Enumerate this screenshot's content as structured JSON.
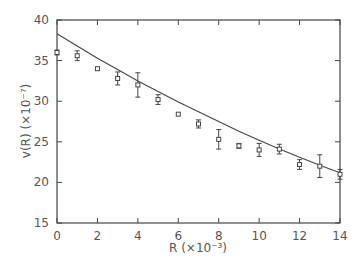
{
  "chart_data": {
    "type": "scatter",
    "title": "",
    "xlabel": "R  (×10⁻³)",
    "ylabel": "v(R)  (×10⁻⁷)",
    "xlim": [
      0,
      14
    ],
    "ylim": [
      15,
      40
    ],
    "xticks": [
      0,
      2,
      4,
      6,
      8,
      10,
      12,
      14
    ],
    "yticks": [
      15,
      20,
      25,
      30,
      35,
      40
    ],
    "grid": false,
    "legend": null,
    "series": [
      {
        "name": "data",
        "marker": "square",
        "x": [
          0,
          1,
          2,
          3,
          4,
          5,
          6,
          7,
          8,
          9,
          10,
          11,
          12,
          13,
          14
        ],
        "y": [
          36.0,
          35.6,
          34.0,
          32.8,
          32.0,
          30.2,
          28.4,
          27.2,
          25.3,
          24.5,
          24.0,
          24.1,
          22.2,
          22.0,
          21.0
        ],
        "err": [
          0.3,
          0.6,
          0.2,
          0.8,
          1.5,
          0.6,
          0.2,
          0.5,
          1.2,
          0.3,
          0.8,
          0.6,
          0.6,
          1.4,
          0.6
        ]
      },
      {
        "name": "fit",
        "type": "line",
        "x": [
          0,
          1,
          2,
          3,
          4,
          5,
          6,
          7,
          8,
          9,
          10,
          11,
          12,
          13,
          14
        ],
        "y": [
          38.3,
          36.8,
          35.3,
          33.9,
          32.5,
          31.2,
          29.9,
          28.7,
          27.5,
          26.3,
          25.2,
          24.1,
          23.1,
          22.1,
          21.2
        ]
      }
    ]
  }
}
